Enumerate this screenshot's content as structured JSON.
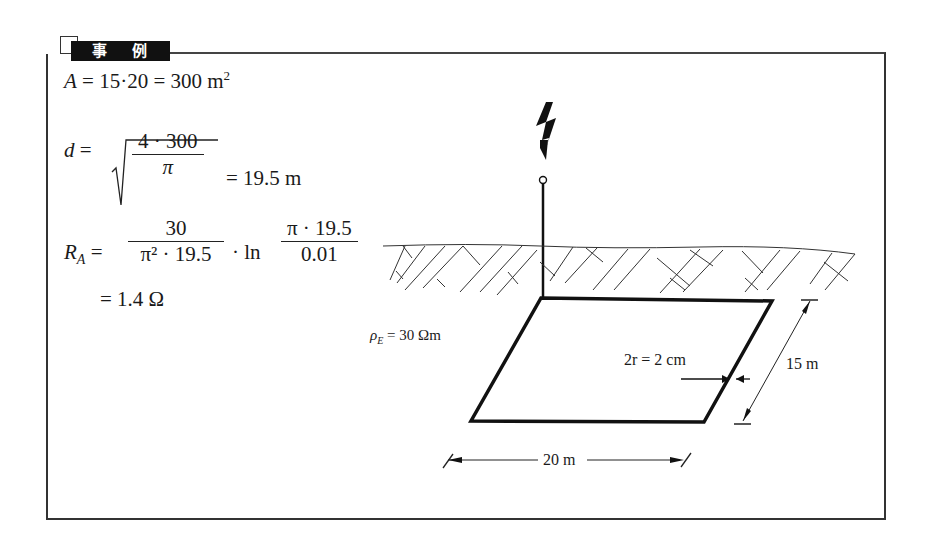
{
  "header": {
    "tab_label": "事 例"
  },
  "equations": {
    "area": {
      "lhs": "A",
      "expr": " = 15·20 = 300 m",
      "exp": "2"
    },
    "diameter": {
      "lhs": "d",
      "eq": " = ",
      "num": "4 · 300",
      "den": "π",
      "result": " = 19.5 m"
    },
    "resistance": {
      "lhs": "R",
      "sub": "A",
      "eq": " = ",
      "num1": "30",
      "den1": "π² · 19.5",
      "mid": " · ln ",
      "num2": "π · 19.5",
      "den2": "0.01",
      "result": "= 1.4 Ω"
    }
  },
  "diagram": {
    "resistivity": {
      "symbol": "ρ",
      "sub": "E",
      "value": " = 30 Ωm"
    },
    "conductor_label": "2r = 2 cm",
    "width_label": "15 m",
    "length_label": "20 m",
    "lightning_icon": "lightning-bolt"
  }
}
